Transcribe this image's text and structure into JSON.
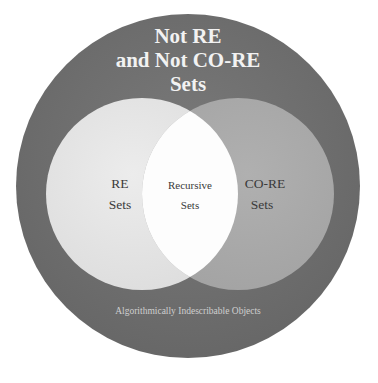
{
  "diagram": {
    "kind": "venn-diagram",
    "background_color": "#ffffff",
    "canvas": {
      "width": 378,
      "height": 383
    },
    "title": {
      "lines": [
        "Not RE",
        "and Not CO-RE",
        "Sets"
      ],
      "color": "#f2f2f2"
    },
    "footer": {
      "text": "Algorithmically Indescribable Objects",
      "color": "#cfcfcf"
    },
    "regions": [
      {
        "id": "universe",
        "role": "outer-universe",
        "label_lines": [
          "Not RE",
          "and Not CO-RE",
          "Sets"
        ],
        "fill": "#6e6e6e",
        "center": {
          "x": 188,
          "y": 186
        },
        "radius": 172
      },
      {
        "id": "re",
        "role": "left-set",
        "label_lines": [
          "RE",
          "Sets"
        ],
        "fill": "#e4e4e4",
        "center": {
          "x": 142,
          "y": 194
        },
        "radius": 96
      },
      {
        "id": "co-re",
        "role": "right-set",
        "label_lines": [
          "CO-RE",
          "Sets"
        ],
        "fill": "#a9a9a9",
        "center": {
          "x": 238,
          "y": 194
        },
        "radius": 96
      },
      {
        "id": "recursive",
        "role": "intersection",
        "label_lines": [
          "Recursive",
          "Sets"
        ],
        "fill": "#fdfdfd"
      }
    ],
    "labels": {
      "re_line1": "RE",
      "re_line2": "Sets",
      "core_line1": "CO-RE",
      "core_line2": "Sets",
      "recursive_line1": "Recursive",
      "recursive_line2": "Sets",
      "title_line1": "Not RE",
      "title_line2": "and Not CO-RE",
      "title_line3": "Sets",
      "footer": "Algorithmically Indescribable Objects"
    }
  }
}
